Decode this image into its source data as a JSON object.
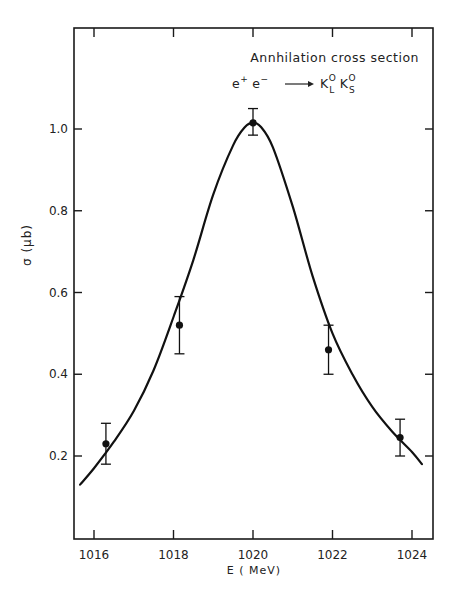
{
  "chart_data": {
    "type": "scatter",
    "title": "Annhilation cross section",
    "subtitle": "e+ e- -> K_L^0 K_S^0",
    "annotation": {
      "line1": "Annhilation cross section",
      "reaction": {
        "e_plus": "e",
        "e_plus_sup": "+",
        "e_minus": "e",
        "e_minus_sup": "−",
        "arrow": "→",
        "k1": "K",
        "k1_sup": "O",
        "k1_sub": "L",
        "k2": "K",
        "k2_sup": "O",
        "k2_sub": "S"
      }
    },
    "xlabel": "E  ( MeV)",
    "ylabel": "σ  (μb)",
    "xlim": [
      1015.5,
      1024.5
    ],
    "ylim": [
      0.1,
      1.2
    ],
    "x_ticks": [
      1016,
      1018,
      1020,
      1022,
      1024
    ],
    "x_tick_labels": [
      "1016",
      "1018",
      "1020",
      "1022",
      "1024"
    ],
    "y_ticks": [
      0.2,
      0.4,
      0.6,
      0.8,
      1.0
    ],
    "y_tick_labels": [
      "0.2",
      "0.4",
      "0.6",
      "0.8",
      "1.0"
    ],
    "grid": false,
    "legend": null,
    "series": [
      {
        "name": "data",
        "kind": "points_with_error_bars",
        "x": [
          1016.3,
          1018.15,
          1020.0,
          1021.9,
          1023.7
        ],
        "y": [
          0.23,
          0.52,
          1.015,
          0.46,
          0.245
        ],
        "y_err_low": [
          0.18,
          0.45,
          0.985,
          0.4,
          0.2
        ],
        "y_err_high": [
          0.28,
          0.59,
          1.05,
          0.52,
          0.29
        ]
      },
      {
        "name": "fit",
        "kind": "curve",
        "x": [
          1015.65,
          1016.0,
          1016.5,
          1017.0,
          1017.5,
          1018.0,
          1018.5,
          1019.0,
          1019.5,
          1019.8,
          1020.0,
          1020.2,
          1020.5,
          1021.0,
          1021.5,
          1022.0,
          1022.5,
          1023.0,
          1023.5,
          1024.0,
          1024.25
        ],
        "y": [
          0.13,
          0.17,
          0.235,
          0.31,
          0.41,
          0.54,
          0.68,
          0.84,
          0.96,
          1.005,
          1.015,
          1.005,
          0.955,
          0.81,
          0.64,
          0.5,
          0.4,
          0.32,
          0.26,
          0.21,
          0.18
        ]
      }
    ],
    "point_color": "#111111",
    "line_color": "#111111"
  }
}
